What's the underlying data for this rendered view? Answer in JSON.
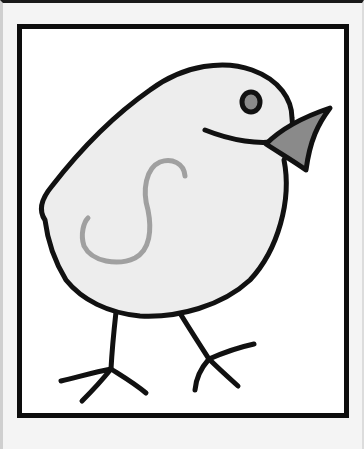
{
  "image": {
    "subject": "bird-illustration",
    "colors": {
      "background": "#f4f4f4",
      "frame_border": "#0d0d0d",
      "frame_fill": "#ffffff",
      "body_fill": "#ededed",
      "outline": "#111111",
      "beak_fill": "#8a8a8a",
      "eye_fill": "#8a8a8a",
      "wing_mark": "#a0a0a0"
    }
  }
}
